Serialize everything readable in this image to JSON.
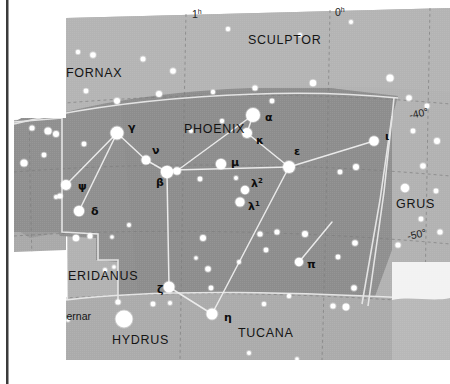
{
  "page": {
    "width": 450,
    "height": 384,
    "background_color": "#ffffff"
  },
  "colors": {
    "sky_outer": "#b4b4b4",
    "sky_inner": "#969696",
    "sky_lower": "#a8a8a8",
    "star_fill": "#ffffff",
    "constellation_line": "#e8e8e8",
    "boundary_line": "#6e6e6e",
    "grid_line": "#8a8a8a",
    "label_color": "#141414",
    "page_edge": "#3a3a3a",
    "inset_panel": "#e2e2e2"
  },
  "chart_data": {
    "type": "scatter",
    "title": "Phoenix",
    "xlabel": "Right Ascension",
    "ylabel": "Declination",
    "grid": true,
    "ra_ticks": [
      {
        "label": "2",
        "unit": "h",
        "x": 36,
        "y": 22
      },
      {
        "label": "1",
        "unit": "h",
        "x": 192,
        "y": 18
      },
      {
        "label": "0",
        "unit": "h",
        "x": 335,
        "y": 16
      }
    ],
    "dec_ticks": [
      {
        "label": "-40°",
        "x": 410,
        "y": 119
      },
      {
        "label": "-50°",
        "x": 408,
        "y": 240
      }
    ],
    "constellation_names": [
      {
        "name": "SCULPTOR",
        "x": 248,
        "y": 44
      },
      {
        "name": "FORNAX",
        "x": 66,
        "y": 77
      },
      {
        "name": "PHOENIX",
        "x": 184,
        "y": 133
      },
      {
        "name": "GRUS",
        "x": 396,
        "y": 208
      },
      {
        "name": "ERIDANUS",
        "x": 68,
        "y": 280
      },
      {
        "name": "HYDRUS",
        "x": 112,
        "y": 344
      },
      {
        "name": "TUCANA",
        "x": 238,
        "y": 337
      }
    ],
    "named_stars": [
      {
        "name": "Achernar",
        "label_x": 91,
        "label_y": 320,
        "star_x": 124,
        "star_y": 319,
        "r": 8.5
      }
    ],
    "greek_stars": [
      {
        "greek": "α",
        "sup": "",
        "star_x": 253,
        "star_y": 115,
        "r": 7.0,
        "label_x": 265,
        "label_y": 121
      },
      {
        "greek": "β",
        "sup": "",
        "star_x": 167,
        "star_y": 172,
        "r": 6.2,
        "label_x": 156,
        "label_y": 186
      },
      {
        "greek": "γ",
        "sup": "",
        "star_x": 117,
        "star_y": 133,
        "r": 6.5,
        "label_x": 128,
        "label_y": 131
      },
      {
        "greek": "δ",
        "sup": "",
        "star_x": 79,
        "star_y": 211,
        "r": 5.2,
        "label_x": 91,
        "label_y": 215
      },
      {
        "greek": "ε",
        "sup": "",
        "star_x": 289,
        "star_y": 167,
        "r": 6.0,
        "label_x": 294,
        "label_y": 155
      },
      {
        "greek": "ζ",
        "sup": "",
        "star_x": 169,
        "star_y": 287,
        "r": 5.5,
        "label_x": 157,
        "label_y": 293
      },
      {
        "greek": "η",
        "sup": "",
        "star_x": 212,
        "star_y": 314,
        "r": 5.5,
        "label_x": 224,
        "label_y": 321
      },
      {
        "greek": "ι",
        "sup": "",
        "star_x": 374,
        "star_y": 141,
        "r": 4.8,
        "label_x": 385,
        "label_y": 140
      },
      {
        "greek": "κ",
        "sup": "",
        "star_x": 247,
        "star_y": 133,
        "r": 5.0,
        "label_x": 256,
        "label_y": 144
      },
      {
        "greek": "λ",
        "sup": "2",
        "star_x": 245,
        "star_y": 190,
        "r": 4.2,
        "label_x": 251,
        "label_y": 187
      },
      {
        "greek": "λ",
        "sup": "1",
        "star_x": 240,
        "star_y": 202,
        "r": 4.6,
        "label_x": 248,
        "label_y": 210
      },
      {
        "greek": "μ",
        "sup": "",
        "star_x": 221,
        "star_y": 164,
        "r": 5.2,
        "label_x": 231,
        "label_y": 166
      },
      {
        "greek": "ν",
        "sup": "",
        "star_x": 146,
        "star_y": 160,
        "r": 4.5,
        "label_x": 152,
        "label_y": 154
      },
      {
        "greek": "π",
        "sup": "",
        "star_x": 299,
        "star_y": 262,
        "r": 4.2,
        "label_x": 307,
        "label_y": 268
      },
      {
        "greek": "ψ",
        "sup": "",
        "star_x": 66,
        "star_y": 185,
        "r": 5.0,
        "label_x": 78,
        "label_y": 190
      }
    ],
    "constellation_lines": [
      {
        "from": "gamma",
        "to": "nu",
        "x1": 117,
        "y1": 133,
        "x2": 146,
        "y2": 160
      },
      {
        "from": "nu",
        "to": "beta",
        "x1": 146,
        "y1": 160,
        "x2": 167,
        "y2": 172
      },
      {
        "from": "beta",
        "to": "epsilon",
        "x1": 167,
        "y1": 172,
        "x2": 289,
        "y2": 167
      },
      {
        "from": "epsilon",
        "to": "kappa",
        "x1": 289,
        "y1": 167,
        "x2": 247,
        "y2": 133
      },
      {
        "from": "kappa",
        "to": "alpha",
        "x1": 247,
        "y1": 133,
        "x2": 253,
        "y2": 115
      },
      {
        "from": "alpha",
        "to": "beta-branch",
        "x1": 253,
        "y1": 115,
        "x2": 182,
        "y2": 169
      },
      {
        "from": "epsilon",
        "to": "iota",
        "x1": 289,
        "y1": 167,
        "x2": 374,
        "y2": 141
      },
      {
        "from": "epsilon",
        "to": "eta",
        "x1": 289,
        "y1": 167,
        "x2": 212,
        "y2": 314
      },
      {
        "from": "gamma",
        "to": "psi",
        "x1": 117,
        "y1": 133,
        "x2": 66,
        "y2": 185
      },
      {
        "from": "gamma",
        "to": "delta",
        "x1": 117,
        "y1": 133,
        "x2": 79,
        "y2": 211
      },
      {
        "from": "beta",
        "to": "zeta",
        "x1": 167,
        "y1": 172,
        "x2": 169,
        "y2": 287
      },
      {
        "from": "zeta",
        "to": "eta",
        "x1": 169,
        "y1": 287,
        "x2": 212,
        "y2": 314
      },
      {
        "from": "pi",
        "to": "upper",
        "x1": 299,
        "y1": 262,
        "x2": 330,
        "y2": 224
      }
    ],
    "field_stars": [
      {
        "x": 62,
        "y": 50,
        "r": 2.6
      },
      {
        "x": 78,
        "y": 52,
        "r": 2.2
      },
      {
        "x": 93,
        "y": 55,
        "r": 2.8
      },
      {
        "x": 143,
        "y": 59,
        "r": 2.5
      },
      {
        "x": 173,
        "y": 71,
        "r": 2.8
      },
      {
        "x": 228,
        "y": 29,
        "r": 2.2
      },
      {
        "x": 300,
        "y": 35,
        "r": 2.0
      },
      {
        "x": 313,
        "y": 83,
        "r": 3.2
      },
      {
        "x": 351,
        "y": 22,
        "r": 2.0
      },
      {
        "x": 390,
        "y": 78,
        "r": 3.6
      },
      {
        "x": 117,
        "y": 101,
        "r": 3.0
      },
      {
        "x": 159,
        "y": 94,
        "r": 3.0
      },
      {
        "x": 60,
        "y": 107,
        "r": 2.8
      },
      {
        "x": 86,
        "y": 91,
        "r": 2.4
      },
      {
        "x": 213,
        "y": 92,
        "r": 2.2
      },
      {
        "x": 255,
        "y": 88,
        "r": 2.6
      },
      {
        "x": 32,
        "y": 128,
        "r": 2.6
      },
      {
        "x": 48,
        "y": 131,
        "r": 3.6
      },
      {
        "x": 56,
        "y": 134,
        "r": 3.0
      },
      {
        "x": 44,
        "y": 155,
        "r": 2.4
      },
      {
        "x": 24,
        "y": 163,
        "r": 3.6
      },
      {
        "x": 84,
        "y": 144,
        "r": 2.4
      },
      {
        "x": 177,
        "y": 171,
        "r": 3.8
      },
      {
        "x": 200,
        "y": 179,
        "r": 2.4
      },
      {
        "x": 236,
        "y": 178,
        "r": 2.0
      },
      {
        "x": 272,
        "y": 101,
        "r": 2.4
      },
      {
        "x": 409,
        "y": 98,
        "r": 2.8
      },
      {
        "x": 427,
        "y": 106,
        "r": 2.4
      },
      {
        "x": 413,
        "y": 131,
        "r": 2.4
      },
      {
        "x": 437,
        "y": 141,
        "r": 3.0
      },
      {
        "x": 423,
        "y": 166,
        "r": 2.8
      },
      {
        "x": 405,
        "y": 188,
        "r": 4.2
      },
      {
        "x": 356,
        "y": 167,
        "r": 3.0
      },
      {
        "x": 340,
        "y": 172,
        "r": 2.4
      },
      {
        "x": 436,
        "y": 191,
        "r": 2.4
      },
      {
        "x": 421,
        "y": 219,
        "r": 2.4
      },
      {
        "x": 440,
        "y": 232,
        "r": 2.6
      },
      {
        "x": 398,
        "y": 245,
        "r": 2.6
      },
      {
        "x": 355,
        "y": 243,
        "r": 2.8
      },
      {
        "x": 338,
        "y": 257,
        "r": 2.4
      },
      {
        "x": 260,
        "y": 234,
        "r": 2.6
      },
      {
        "x": 277,
        "y": 232,
        "r": 2.6
      },
      {
        "x": 266,
        "y": 250,
        "r": 2.4
      },
      {
        "x": 305,
        "y": 234,
        "r": 3.0
      },
      {
        "x": 203,
        "y": 238,
        "r": 3.0
      },
      {
        "x": 208,
        "y": 269,
        "r": 2.8
      },
      {
        "x": 60,
        "y": 196,
        "r": 2.6
      },
      {
        "x": 76,
        "y": 238,
        "r": 3.2
      },
      {
        "x": 90,
        "y": 236,
        "r": 2.6
      },
      {
        "x": 36,
        "y": 262,
        "r": 3.2
      },
      {
        "x": 105,
        "y": 270,
        "r": 2.0
      },
      {
        "x": 114,
        "y": 267,
        "r": 1.8
      },
      {
        "x": 56,
        "y": 197,
        "r": 2.0
      },
      {
        "x": 118,
        "y": 302,
        "r": 2.6
      },
      {
        "x": 68,
        "y": 320,
        "r": 1.8
      },
      {
        "x": 153,
        "y": 304,
        "r": 2.4
      },
      {
        "x": 170,
        "y": 303,
        "r": 2.0
      },
      {
        "x": 211,
        "y": 288,
        "r": 2.4
      },
      {
        "x": 196,
        "y": 258,
        "r": 1.8
      },
      {
        "x": 239,
        "y": 262,
        "r": 2.0
      },
      {
        "x": 289,
        "y": 296,
        "r": 2.2
      },
      {
        "x": 264,
        "y": 304,
        "r": 2.2
      },
      {
        "x": 354,
        "y": 288,
        "r": 2.8
      },
      {
        "x": 333,
        "y": 306,
        "r": 2.6
      },
      {
        "x": 346,
        "y": 307,
        "r": 3.4
      },
      {
        "x": 249,
        "y": 353,
        "r": 2.0
      },
      {
        "x": 297,
        "y": 359,
        "r": 1.8
      },
      {
        "x": 430,
        "y": 282,
        "r": 2.8
      },
      {
        "x": 112,
        "y": 237,
        "r": 1.8
      },
      {
        "x": 222,
        "y": 121,
        "r": 2.2
      },
      {
        "x": 129,
        "y": 225,
        "r": 2.0
      },
      {
        "x": 191,
        "y": 131,
        "r": 2.0
      }
    ]
  }
}
